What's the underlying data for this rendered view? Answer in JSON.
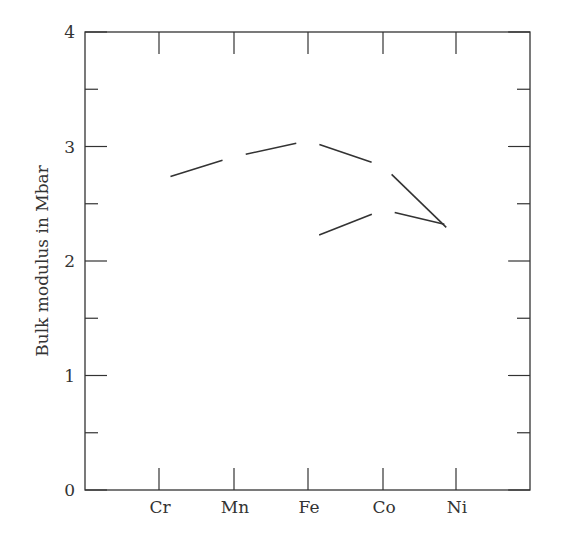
{
  "chart_data": {
    "type": "scatter",
    "title": "",
    "xlabel": "",
    "ylabel": "Bulk modulus in Mbar",
    "categories": [
      "Cr",
      "Mn",
      "Fe",
      "Co",
      "Ni"
    ],
    "ylim": [
      0,
      4
    ],
    "yticks": [
      0,
      1,
      2,
      3,
      4
    ],
    "yticks_minor": [
      0.5,
      1.5,
      2.5,
      3.5
    ],
    "grid": false,
    "legend_position": "lower right inside",
    "series": [
      {
        "name": "spin-pol. calc",
        "marker": "triangle",
        "values": [
          2.69,
          1.91,
          2.17,
          2.43,
          2.28
        ],
        "connected_segments": [
          [
            0,
            "nonmagn:1"
          ],
          [
            2,
            3
          ],
          [
            3,
            4
          ]
        ]
      },
      {
        "name": "exp.",
        "marker": "cross",
        "values": [
          1.93,
          0.96,
          1.75,
          1.97,
          1.88
        ]
      },
      {
        "name": "nonmagn. calc",
        "marker": "circle",
        "values": [
          null,
          2.91,
          3.05,
          2.83,
          2.21
        ]
      }
    ]
  },
  "axes": {
    "ylabel": "Bulk modulus in Mbar",
    "yticks": [
      "0",
      "1",
      "2",
      "3",
      "4"
    ],
    "xticks": [
      "Cr",
      "Mn",
      "Fe",
      "Co",
      "Ni"
    ]
  },
  "legend": {
    "items": [
      {
        "label": "spin-pol. calc",
        "marker": "triangle"
      },
      {
        "label": "exp.",
        "marker": "cross"
      },
      {
        "label": "nonmagn. calc",
        "marker": "circle"
      }
    ]
  }
}
